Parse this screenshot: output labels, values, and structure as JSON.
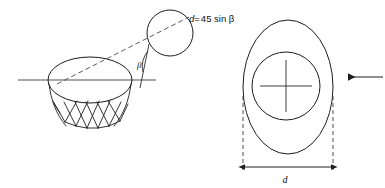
{
  "figure": {
    "background_color": "#ffffff",
    "line_color": "#1d1d1d",
    "width": 385,
    "height": 188
  },
  "annotations": {
    "equation": {
      "full": "d=45 sin β",
      "variable": "d",
      "operator": "=",
      "expression": "45 sin β",
      "coefficient": "45",
      "function": "sin",
      "angle_symbol": "β"
    },
    "angle_label": "β",
    "dimension_label": "d"
  },
  "left_view": {
    "name": "side-view-hoop-and-ball",
    "hoop_rim": {
      "shape": "ellipse",
      "center_x": 90,
      "center_y": 80,
      "rx": 42,
      "ry": 23
    },
    "horizontal_axis": {
      "x1": 18,
      "x2": 156,
      "y": 80
    },
    "ball": {
      "shape": "circle",
      "center_x": 170,
      "center_y": 33,
      "r": 23
    },
    "trajectory": {
      "style": "dashed",
      "x1": 57,
      "y1": 84,
      "x2": 189,
      "y2": 17
    },
    "angle_arc": {
      "vertex_x": 140,
      "vertex_y": 80,
      "value_symbol": "β"
    },
    "net": {
      "rows": 2,
      "strands": 8,
      "top_y": 100,
      "bottom_y": 131
    }
  },
  "right_view": {
    "name": "front-view-effective-opening",
    "outer_ellipse": {
      "center_x": 288,
      "center_y": 87,
      "rx": 45,
      "ry": 67
    },
    "inner_circle": {
      "center_x": 286,
      "center_y": 86,
      "r": 34
    },
    "crosshair": {
      "center_x": 286,
      "center_y": 86,
      "half_length": 26
    },
    "extension_lines": {
      "left_x": 243,
      "right_x": 333,
      "top_y": 96,
      "bottom_y": 170
    },
    "dimension_line": {
      "y": 167,
      "x1": 243,
      "x2": 333,
      "label": "d"
    },
    "velocity_arrow": {
      "direction": "left",
      "y": 77,
      "tail_x": 383,
      "head_x": 345
    }
  }
}
